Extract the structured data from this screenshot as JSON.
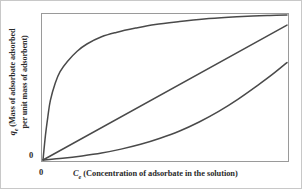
{
  "chart_data": {
    "type": "line",
    "title": "",
    "subtitle": "",
    "xlabel": "Ce (Concentration of adsorbate in the solution)",
    "ylabel": "qe (Mass of adsorbate adsorbed per unit mass of adsorbent)",
    "xlabel_symbol": "C",
    "xlabel_symbol_sub": "e",
    "xlabel_text": "(Concentration  of adsorbate in the solution)",
    "ylabel_symbol": "q",
    "ylabel_symbol_sub": "e",
    "ylabel_line1": "(Mass of adsorbate adsorbed",
    "ylabel_line2": "per unit mass of adsorbent)",
    "x_tick_labels": [
      "0"
    ],
    "y_tick_labels": [
      "0"
    ],
    "xlim": [
      0,
      1
    ],
    "ylim": [
      0,
      1
    ],
    "grid": false,
    "legend": "none",
    "legend_position": "none",
    "line_color": "#4a4a4a",
    "frame_color": "#9a9a9a",
    "background_color": "#ffffff",
    "text_color": "#2b2b2b",
    "series": [
      {
        "name": "favorable",
        "shape": "concave-down",
        "x": [
          0.0,
          0.01,
          0.02,
          0.03,
          0.05,
          0.07,
          0.1,
          0.14,
          0.18,
          0.24,
          0.3,
          0.38,
          0.46,
          0.56,
          0.66,
          0.76,
          0.86,
          0.93,
          1.0
        ],
        "values": [
          0.0,
          0.17,
          0.3,
          0.41,
          0.53,
          0.61,
          0.68,
          0.75,
          0.8,
          0.85,
          0.88,
          0.91,
          0.935,
          0.955,
          0.972,
          0.984,
          0.993,
          0.997,
          1.0
        ]
      },
      {
        "name": "linear",
        "shape": "straight",
        "x": [
          0.0,
          1.0
        ],
        "values": [
          0.0,
          0.93
        ]
      },
      {
        "name": "unfavorable",
        "shape": "concave-up",
        "x": [
          0.0,
          0.08,
          0.16,
          0.24,
          0.32,
          0.4,
          0.48,
          0.56,
          0.64,
          0.72,
          0.8,
          0.88,
          0.94,
          1.0
        ],
        "values": [
          0.0,
          0.012,
          0.028,
          0.048,
          0.075,
          0.108,
          0.15,
          0.2,
          0.262,
          0.335,
          0.42,
          0.515,
          0.59,
          0.672
        ]
      }
    ]
  }
}
